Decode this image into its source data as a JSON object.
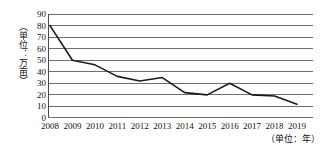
{
  "chart_data": {
    "type": "line",
    "title": "",
    "subtitle": "",
    "xlabel": "（单位：年）",
    "ylabel": "（单位：万亩）",
    "categories": [
      "2008",
      "2009",
      "2010",
      "2011",
      "2012",
      "2013",
      "2014",
      "2015",
      "2016",
      "2017",
      "2018",
      "2019"
    ],
    "x": [
      2008,
      2009,
      2010,
      2011,
      2012,
      2013,
      2014,
      2015,
      2016,
      2017,
      2018,
      2019
    ],
    "values": [
      80,
      50,
      46,
      36,
      32,
      35,
      22,
      20,
      30,
      20,
      19,
      12
    ],
    "series": [
      {
        "name": "",
        "values": [
          80,
          50,
          46,
          36,
          32,
          35,
          22,
          20,
          30,
          20,
          19,
          12
        ]
      }
    ],
    "ylim": [
      0,
      90
    ],
    "y_ticks": [
      0,
      10,
      20,
      30,
      40,
      50,
      60,
      70,
      80,
      90
    ],
    "y_tick_labels": [
      "0",
      "10",
      "20",
      "30",
      "40",
      "50",
      "60",
      "70",
      "80",
      "90"
    ],
    "grid": true,
    "grid_axis": "y",
    "legend": false,
    "legend_position": "none",
    "line_color": "#1a1a1a",
    "grid_color": "#6e6e6e",
    "axis_color": "#4a4a4a",
    "background_color": "#ffffff",
    "markers": false,
    "annotations": []
  }
}
